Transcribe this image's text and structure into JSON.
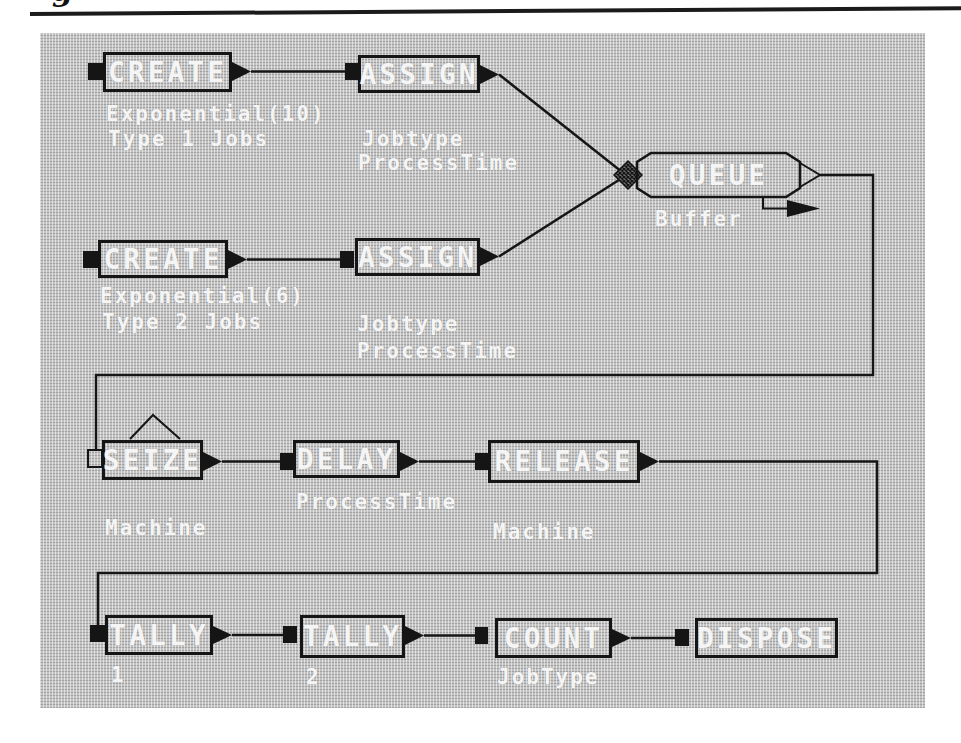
{
  "page": {
    "caption_remnant": "g"
  },
  "diagram": {
    "colors": {
      "panel_gray": "#c3c3c3",
      "ink_black": "#151515",
      "text_white": "#ffffff"
    },
    "blocks": [
      {
        "label": "CREATE",
        "annotations": [
          "Exponential(10)",
          "Type 1 Jobs"
        ]
      },
      {
        "label": "ASSIGN",
        "annotations": [
          "Jobtype",
          "ProcessTime"
        ]
      },
      {
        "label": "QUEUE",
        "annotations": [
          "Buffer"
        ]
      },
      {
        "label": "CREATE",
        "annotations": [
          "Exponential(6)",
          "Type 2 Jobs"
        ]
      },
      {
        "label": "ASSIGN",
        "annotations": [
          "Jobtype",
          "ProcessTime"
        ]
      },
      {
        "label": "SEIZE",
        "annotations": [
          "Machine"
        ]
      },
      {
        "label": "DELAY",
        "annotations": [
          "ProcessTime"
        ]
      },
      {
        "label": "RELEASE",
        "annotations": [
          "Machine"
        ]
      },
      {
        "label": "TALLY",
        "annotations": [
          "1"
        ]
      },
      {
        "label": "TALLY",
        "annotations": [
          "2"
        ]
      },
      {
        "label": "COUNT",
        "annotations": [
          "JobType"
        ]
      },
      {
        "label": "DISPOSE",
        "annotations": []
      }
    ]
  }
}
